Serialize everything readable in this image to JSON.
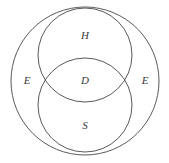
{
  "figure": {
    "type": "venn-diagram",
    "background_color": "#ffffff",
    "stroke_color": "#5a5a5a",
    "label_color": "#3a3a3a",
    "width": 169,
    "height": 163
  },
  "sets": [
    {
      "id": "universe",
      "label": "E",
      "role": "outer-universal-set",
      "cx": 85,
      "cy": 81,
      "r": 74
    },
    {
      "id": "upper",
      "label": "H",
      "role": "upper-set",
      "cx": 85,
      "cy": 55,
      "r": 47
    },
    {
      "id": "lower",
      "label": "S",
      "role": "lower-set",
      "cx": 85,
      "cy": 105,
      "r": 47
    }
  ],
  "labels": [
    {
      "id": "label-h",
      "text": "H",
      "x": 85,
      "y": 36
    },
    {
      "id": "label-d",
      "text": "D",
      "x": 85,
      "y": 81
    },
    {
      "id": "label-s",
      "text": "S",
      "x": 85,
      "y": 126
    },
    {
      "id": "label-e-left",
      "text": "E",
      "x": 27,
      "y": 81
    },
    {
      "id": "label-e-right",
      "text": "E",
      "x": 145,
      "y": 81
    }
  ],
  "regions": {
    "upper_only": "H",
    "lower_only": "S",
    "intersection": "D",
    "universe_left": "E",
    "universe_right": "E"
  }
}
